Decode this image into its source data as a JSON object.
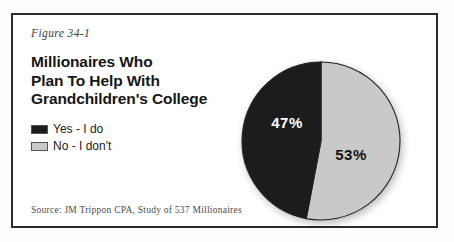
{
  "figure": {
    "caption": "Figure 34-1",
    "title_lines": [
      "Millionaires Who",
      "Plan To Help With",
      "Grandchildren's College"
    ],
    "source": "Source: JM Trippon CPA, Study of 537 Millionaires",
    "border_color": "#2b2b2b",
    "background": "#ffffff"
  },
  "legend": {
    "items": [
      {
        "label": "Yes - I do",
        "color": "#1c1c1c"
      },
      {
        "label": "No - I don't",
        "color": "#c9c9c9"
      }
    ]
  },
  "chart_data": {
    "type": "pie",
    "title": "Millionaires Who Plan To Help With Grandchildren's College",
    "categories": [
      "Yes - I do",
      "No - I don't"
    ],
    "values": [
      47,
      53
    ],
    "value_labels": [
      "47%",
      "53%"
    ],
    "colors": [
      "#1c1c1c",
      "#c9c9c9"
    ],
    "label_text_colors": [
      "#ffffff",
      "#111111"
    ],
    "units": "percent",
    "legend_position": "left",
    "start_angle_deg": 0,
    "direction": "clockwise",
    "grid": false,
    "xlabel": "",
    "ylabel": "",
    "annotations": [
      "Source: JM Trippon CPA, Study of 537 Millionaires"
    ]
  }
}
